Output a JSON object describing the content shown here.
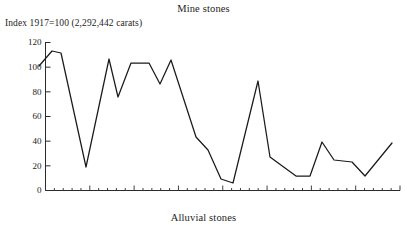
{
  "chart_data": {
    "type": "line",
    "title": "Mine stones",
    "subtitle": "Index  1917=100 (2,292,442 carats)",
    "footer": "Alluvial stones",
    "xlabel": "",
    "ylabel": "",
    "ylim": [
      0,
      120
    ],
    "yticks": [
      0,
      20,
      40,
      60,
      80,
      100,
      120
    ],
    "ytick_labels": [
      "0",
      "20",
      "40",
      "60",
      "80",
      "100",
      "120"
    ],
    "grid": false,
    "legend": "none",
    "x_minor_tick_count": 40,
    "x_major_tick_every": 5,
    "series": [
      {
        "name": "Mine stones index",
        "x": [
          0,
          1,
          2,
          3,
          4,
          5,
          6,
          7,
          8,
          9,
          10,
          11,
          12,
          13,
          14,
          15,
          16,
          17,
          18,
          19,
          20,
          21,
          22,
          23,
          24,
          25,
          26,
          27,
          28,
          29,
          30,
          31,
          32,
          33,
          34,
          35,
          36,
          37,
          38,
          39
        ],
        "values": [
          100,
          106,
          112,
          111,
          109,
          88,
          63,
          40,
          18,
          42,
          63,
          82,
          101,
          76,
          88,
          102,
          102,
          102,
          93,
          84,
          90,
          98,
          83,
          66,
          49,
          42,
          41,
          33,
          21,
          9,
          30,
          52,
          70,
          88,
          56,
          30,
          14,
          14,
          14,
          14
        ],
        "values_tail": [
          33,
          41,
          27,
          26,
          24,
          12,
          10,
          20,
          38
        ]
      }
    ],
    "points": [
      [
        39,
        66
      ],
      [
        52,
        51
      ],
      [
        61,
        53
      ],
      [
        86,
        167
      ],
      [
        109,
        59
      ],
      [
        118,
        97
      ],
      [
        131,
        63
      ],
      [
        149,
        63
      ],
      [
        160,
        84
      ],
      [
        171,
        60
      ],
      [
        196,
        137
      ],
      [
        208,
        150
      ],
      [
        221,
        179
      ],
      [
        233,
        183
      ],
      [
        258,
        81
      ],
      [
        270,
        157
      ],
      [
        285,
        168
      ],
      [
        296,
        176
      ],
      [
        310,
        176
      ],
      [
        322,
        142
      ],
      [
        334,
        160
      ],
      [
        352,
        162
      ],
      [
        365,
        176
      ],
      [
        392,
        143
      ]
    ]
  }
}
